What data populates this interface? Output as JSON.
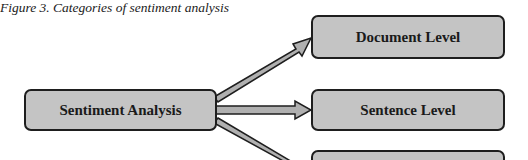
{
  "caption": "Figure 3. Categories of sentiment analysis",
  "diagram": {
    "root": {
      "label": "Sentiment Analysis"
    },
    "children": [
      {
        "label": "Document Level"
      },
      {
        "label": "Sentence Level"
      },
      {
        "label": ""
      }
    ],
    "colors": {
      "box_fill": "#c4c4c4",
      "box_border": "#1e1e1e",
      "arrow_fill": "#b0b0b0"
    }
  }
}
